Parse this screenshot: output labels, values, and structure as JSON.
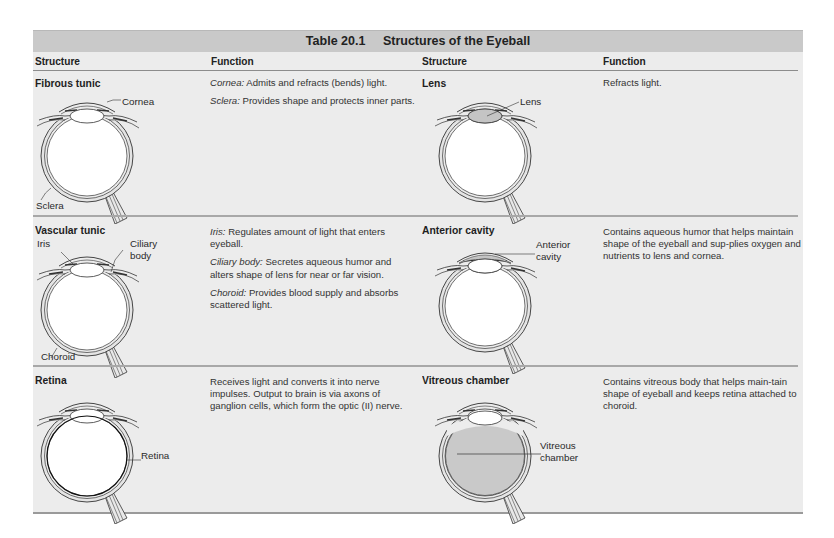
{
  "table": {
    "number": "Table 20.1",
    "title": "Structures of the Eyeball",
    "headers": [
      "Structure",
      "Function",
      "Structure",
      "Function"
    ],
    "rows": [
      {
        "left": {
          "structure": "Fibrous tunic",
          "labels": [
            "Cornea",
            "Sclera"
          ],
          "functions": [
            {
              "term": "Cornea:",
              "text": " Admits and refracts (bends) light."
            },
            {
              "term": "Sclera:",
              "text": " Provides shape and protects inner parts."
            }
          ]
        },
        "right": {
          "structure": "Lens",
          "labels": [
            "Lens"
          ],
          "functions": [
            {
              "term": "",
              "text": "Refracts light."
            }
          ]
        }
      },
      {
        "left": {
          "structure": "Vascular tunic",
          "labels": [
            "Iris",
            "Ciliary",
            "body",
            "Choroid"
          ],
          "functions": [
            {
              "term": "Iris:",
              "text": " Regulates amount of light that enters eyeball."
            },
            {
              "term": "Ciliary body:",
              "text": " Secretes aqueous humor and alters shape of lens for near or far vision."
            },
            {
              "term": "Choroid:",
              "text": " Provides blood supply and absorbs scattered light."
            }
          ]
        },
        "right": {
          "structure": "Anterior cavity",
          "labels": [
            "Anterior",
            "cavity"
          ],
          "functions": [
            {
              "term": "",
              "text": "Contains aqueous humor that helps maintain shape of the eyeball and sup-plies oxygen and nutrients to lens and cornea."
            }
          ]
        }
      },
      {
        "left": {
          "structure": "Retina",
          "labels": [
            "Retina"
          ],
          "functions": [
            {
              "term": "",
              "text": "Receives light and converts it into nerve impulses. Output to brain is via axons of ganglion cells, which form the optic (II) nerve."
            }
          ]
        },
        "right": {
          "structure": "Vitreous chamber",
          "labels": [
            "Vitreous",
            "chamber"
          ],
          "functions": [
            {
              "term": "",
              "text": "Contains vitreous body that helps main-tain shape of eyeball and keeps retina attached to choroid."
            }
          ]
        }
      }
    ]
  },
  "colors": {
    "title_bar": "#c9c9c9",
    "body_bg": "#ececec",
    "highlight_fill": "#c4c4c4"
  }
}
